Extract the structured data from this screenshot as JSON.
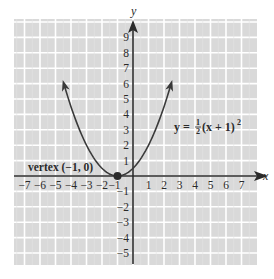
{
  "chart_data": {
    "type": "line",
    "title": "",
    "xlabel": "x",
    "ylabel": "y",
    "xlim": [
      -7.5,
      8
    ],
    "ylim": [
      -5.8,
      10
    ],
    "grid": true,
    "x_ticks": [
      "−7",
      "−6",
      "−5",
      "−4",
      "−3",
      "−2",
      "−1",
      "1",
      "2",
      "3",
      "4",
      "5",
      "6",
      "7"
    ],
    "x_tick_values": [
      -7,
      -6,
      -5,
      -4,
      -3,
      -2,
      -1,
      1,
      2,
      3,
      4,
      5,
      6,
      7
    ],
    "y_ticks": [
      "9",
      "8",
      "7",
      "6",
      "5",
      "4",
      "3",
      "2",
      "1",
      "−1",
      "−2",
      "−3",
      "−4",
      "−5"
    ],
    "y_tick_values": [
      9,
      8,
      7,
      6,
      5,
      4,
      3,
      2,
      1,
      -1,
      -2,
      -3,
      -4,
      -5
    ],
    "series": [
      {
        "name": "y = ½(x + 1)²",
        "equation": "y = 1/2 (x + 1)^2",
        "x_range": [
          -4.46,
          2.46
        ],
        "points": [
          [
            -4.46,
            6
          ],
          [
            -4,
            4.5
          ],
          [
            -3,
            2
          ],
          [
            -2,
            0.5
          ],
          [
            -1,
            0
          ],
          [
            0,
            0.5
          ],
          [
            1,
            2
          ],
          [
            2,
            4.5
          ],
          [
            2.46,
            6
          ]
        ],
        "arrows_at_ends": true
      }
    ],
    "annotations": [
      {
        "text": "vertex (−1, 0)",
        "x": -1,
        "y": 0,
        "marker": "filled-dot"
      },
      {
        "text": "y = ½(x + 1)²",
        "position": "right of curve, near y=3"
      }
    ],
    "colors": {
      "grid_background": "#d9d9d9",
      "grid_lines": "#ffffff",
      "axes": "#2a2a2a",
      "curve": "#3a3a3a"
    }
  },
  "labels": {
    "x_axis": "x",
    "y_axis": "y",
    "vertex": "vertex (−1, 0)",
    "equation_lhs": "y = ",
    "equation_num": "1",
    "equation_den": "2",
    "equation_rhs": "(x + 1)",
    "equation_exp": "2"
  }
}
